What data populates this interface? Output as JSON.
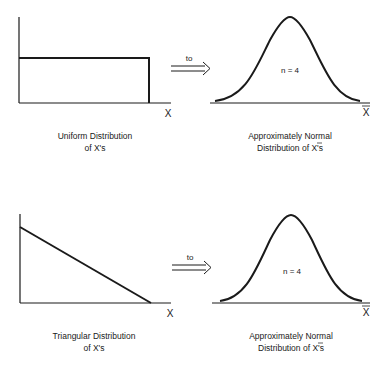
{
  "panels": [
    {
      "source": {
        "shape": "uniform",
        "axis_label": "X",
        "caption_line1": "Uniform Distribution",
        "caption_line2": "of X's"
      },
      "arrow_label": "to",
      "result": {
        "shape": "normal",
        "sample_size_label": "n = 4",
        "axis_label": "X",
        "caption_line1": "Approximately Normal",
        "caption_line2": "Distribution of X's"
      }
    },
    {
      "source": {
        "shape": "triangular",
        "axis_label": "X",
        "caption_line1": "Triangular Distribution",
        "caption_line2": "of X's"
      },
      "arrow_label": "to",
      "result": {
        "shape": "normal",
        "sample_size_label": "n = 4",
        "axis_label": "X",
        "caption_line1": "Approximately Normal",
        "caption_line2": "Distribution of X's"
      }
    }
  ],
  "colors": {
    "stroke": "#1a1a1a",
    "background": "#ffffff"
  }
}
